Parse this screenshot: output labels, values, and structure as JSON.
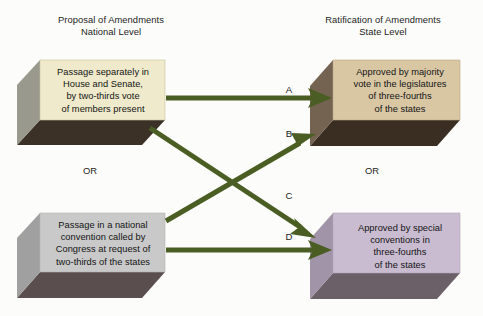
{
  "headers": {
    "left": "Proposal of Amendments\nNational Level",
    "right": "Ratification of Amendments\nState Level"
  },
  "connectors": {
    "or_left": "OR",
    "or_right": "OR"
  },
  "boxes": [
    {
      "id": "propose-congress",
      "side": "left",
      "text": "Passage separately in\nHouse and Senate,\nby two-thirds vote\nof members present",
      "face_color": "#eeeacb",
      "side_color": "#9a998d",
      "bottom_color": "#3b3127"
    },
    {
      "id": "propose-convention",
      "side": "left",
      "text": "Passage in a national\nconvention called by\nCongress at request of\ntwo-thirds of the states",
      "face_color": "#c9c9c9",
      "side_color": "#a0a0a0",
      "bottom_color": "#5a4e4e"
    },
    {
      "id": "ratify-legislature",
      "side": "right",
      "text": "Approved by majority\nvote in the legislatures\nof three-fourths\nof the states",
      "face_color": "#d9c7a4",
      "side_color": "#736350",
      "bottom_color": "#3a2e22"
    },
    {
      "id": "ratify-convention",
      "side": "right",
      "text": "Approved by special\nconventions in\nthree-fourths\nof the states",
      "face_color": "#c9bcd0",
      "side_color": "#a294a8",
      "bottom_color": "#6b5f68"
    }
  ],
  "arrows": [
    {
      "label": "A",
      "from": "propose-congress",
      "to": "ratify-legislature"
    },
    {
      "label": "B",
      "from": "propose-convention",
      "to": "ratify-legislature"
    },
    {
      "label": "C",
      "from": "propose-congress",
      "to": "ratify-convention"
    },
    {
      "label": "D",
      "from": "propose-convention",
      "to": "ratify-convention"
    }
  ],
  "colors": {
    "arrow": "#4a5d23",
    "background": "#fcfcfa",
    "text": "#141414"
  }
}
